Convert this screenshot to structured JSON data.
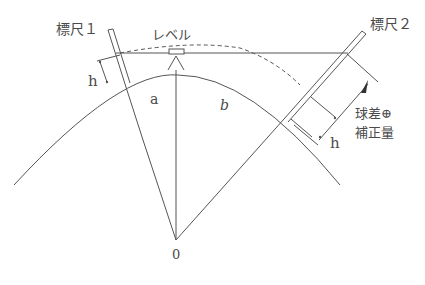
{
  "diagram": {
    "labels": {
      "staff1": "標尺１",
      "staff2": "標尺２",
      "level": "レベル",
      "h_left": "h",
      "h_right": "h",
      "a": "a",
      "b": "b",
      "center": "0",
      "correction_line1": "球差⊕",
      "correction_line2": "補正量"
    },
    "colors": {
      "line": "#555555",
      "text": "#4a4a4a",
      "background": "#ffffff"
    }
  }
}
